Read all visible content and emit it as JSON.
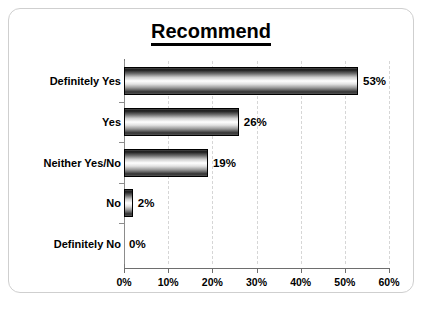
{
  "chart_data": {
    "type": "bar",
    "orientation": "horizontal",
    "title": "Recommend",
    "xlabel": "",
    "ylabel": "",
    "categories": [
      "Definitely Yes",
      "Yes",
      "Neither Yes/No",
      "No",
      "Definitely No"
    ],
    "values": [
      53,
      26,
      19,
      2,
      0
    ],
    "value_labels": [
      "53%",
      "26%",
      "19%",
      "2%",
      "0%"
    ],
    "xlim": [
      0,
      60
    ],
    "xticks": [
      0,
      10,
      20,
      30,
      40,
      50,
      60
    ],
    "xtick_labels": [
      "0%",
      "10%",
      "20%",
      "30%",
      "40%",
      "50%",
      "60%"
    ],
    "grid": "vertical-dashed",
    "legend": "none",
    "series": [
      {
        "name": "Recommend",
        "values": [
          53,
          26,
          19,
          2,
          0
        ]
      }
    ],
    "colors": {
      "bar_fill_highlight": "#ffffff",
      "bar_fill_shadow": "#1a1a1a",
      "bar_border": "#000000",
      "gridline": "#d6d6d6",
      "axis": "#6e6e6e",
      "text": "#000000",
      "background": "#ffffff",
      "card_border": "#cfcfcf"
    }
  }
}
